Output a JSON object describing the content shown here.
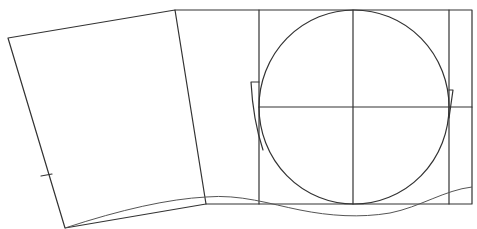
{
  "diagram": {
    "type": "line-drawing",
    "colors": {
      "background": "#ffffff",
      "stroke": "#333333",
      "curve": "#555555"
    },
    "left_panel": {
      "points": [
        [
          8,
          38
        ],
        [
          175,
          10
        ],
        [
          206,
          204
        ],
        [
          65,
          228
        ]
      ],
      "tick": {
        "x1": 41,
        "y1": 176,
        "x2": 52,
        "y2": 174
      }
    },
    "right_panel": {
      "outer": {
        "x": 175,
        "y": 10,
        "right": 472,
        "bottom": 204
      },
      "verticals": [
        259,
        353,
        449
      ],
      "horizontal_y": 107
    },
    "circle": {
      "cx": 354,
      "cy": 107,
      "rx": 95,
      "ry": 97
    },
    "hooks": {
      "left": "M259,82 L251,82 Q253,120 263,150",
      "right": "M449,90 L453,90 L449,118"
    },
    "baseline_curve": "M65,228 Q150,200 206,197 C240,194 270,204 300,210 C330,216 360,218 390,213 C420,207 445,190 472,187"
  }
}
